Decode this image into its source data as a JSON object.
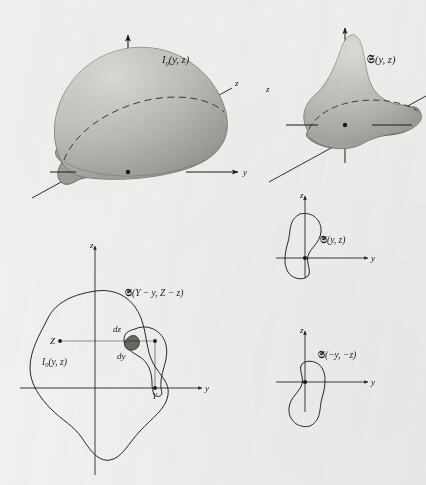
{
  "figure": {
    "title_internal": "convolution-of-object-and-spread-function",
    "background_color": "#f2f1ef",
    "ink_color": "#1a1a1a",
    "surface_fill_light": "#cfcdc9",
    "surface_fill_dark": "#a8a6a1",
    "panels": [
      {
        "id": "top-left",
        "kind": "3d-surface",
        "label": "I₀(y, z)",
        "label_base": "I",
        "label_sub": "0",
        "label_args": "(y, z)",
        "axes": [
          {
            "name": "z-vertical",
            "label": ""
          },
          {
            "name": "y-horizontal",
            "label": "y"
          },
          {
            "name": "z-depth",
            "label": "z"
          }
        ],
        "description": "Smooth shaded blob-like intensity surface over the y-z plane with dashed contour and base outline"
      },
      {
        "id": "top-right",
        "kind": "3d-surface",
        "label": "𝔖(y, z)",
        "label_base": "𝔖",
        "label_args": "(y, z)",
        "axes": [
          {
            "name": "z-vertical",
            "label": ""
          },
          {
            "name": "y-horizontal",
            "label": ""
          },
          {
            "name": "z-depth",
            "label": "z"
          }
        ],
        "description": "Peaked spread-function surface with a lobe extending to the right, dashed rim contour"
      },
      {
        "id": "middle-right",
        "kind": "contour",
        "label": "𝔖(y, z)",
        "label_base": "𝔖",
        "label_args": "(y, z)",
        "axes": [
          {
            "name": "z-vertical",
            "label": "z"
          },
          {
            "name": "y-horizontal",
            "label": "y"
          }
        ],
        "description": "Plan-view contour of the spread function centred on the origin"
      },
      {
        "id": "bottom-right",
        "kind": "contour",
        "label": "𝔖(−y, −z)",
        "label_base": "𝔖",
        "label_args": "(−y, −z)",
        "axes": [
          {
            "name": "z-vertical",
            "label": "z"
          },
          {
            "name": "y-horizontal",
            "label": "y"
          }
        ],
        "description": "Point-inverted contour of the spread function centred on the origin"
      },
      {
        "id": "bottom-left",
        "kind": "contour-overlay",
        "labels": {
          "object": "I₀(y, z)",
          "object_base": "I",
          "object_sub": "0",
          "object_args": "(y, z)",
          "spread": "𝔖(Y − y, Z − z)",
          "spread_base": "𝔖",
          "spread_args": "(Y − y, Z − z)"
        },
        "point_labels": [
          {
            "name": "Z",
            "text": "Z"
          },
          {
            "name": "Y",
            "text": "Y"
          },
          {
            "name": "dz",
            "text": "dz"
          },
          {
            "name": "dy",
            "text": "dy"
          }
        ],
        "axes": [
          {
            "name": "z-vertical",
            "label": "z"
          },
          {
            "name": "y-horizontal",
            "label": "y"
          }
        ],
        "description": "Large object contour overlapped by the shifted, inverted spread function contour; shaded element of area dy dz at the intersection, with dotted construction lines to Z on the z-axis and Y on the y-axis"
      }
    ]
  }
}
